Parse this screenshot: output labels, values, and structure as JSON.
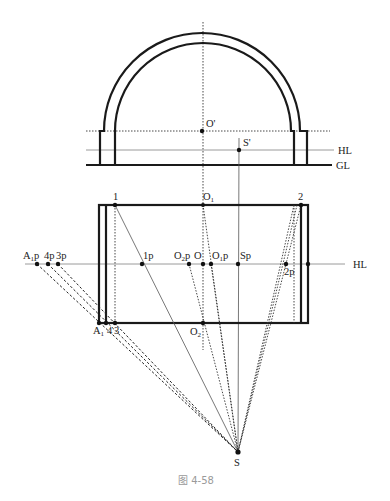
{
  "figure": {
    "caption": "图 4-58",
    "elevation": {
      "labels": {
        "O_prime": "O'",
        "S_prime": "S'",
        "HL": "HL",
        "GL": "GL"
      }
    },
    "plan": {
      "labels": {
        "p1": "1",
        "O1": "O",
        "O1_sub": "1",
        "p2": "2",
        "A1p": "A",
        "A1p_sub": "1",
        "A1p_suffix": "p",
        "p4p": "4p",
        "p3p": "3p",
        "p1p": "1p",
        "O2p": "O",
        "O2p_sub": "2",
        "O2p_suffix": "p",
        "O": "O",
        "O1p": "O",
        "O1p_sub": "1",
        "O1p_suffix": "p",
        "Sp": "Sp",
        "p2p": "2p",
        "HL": "HL",
        "A1": "A",
        "A1_sub": "1",
        "p4": "4",
        "p3": "3",
        "O2": "O",
        "O2_sub": "2",
        "S": "S"
      }
    }
  }
}
